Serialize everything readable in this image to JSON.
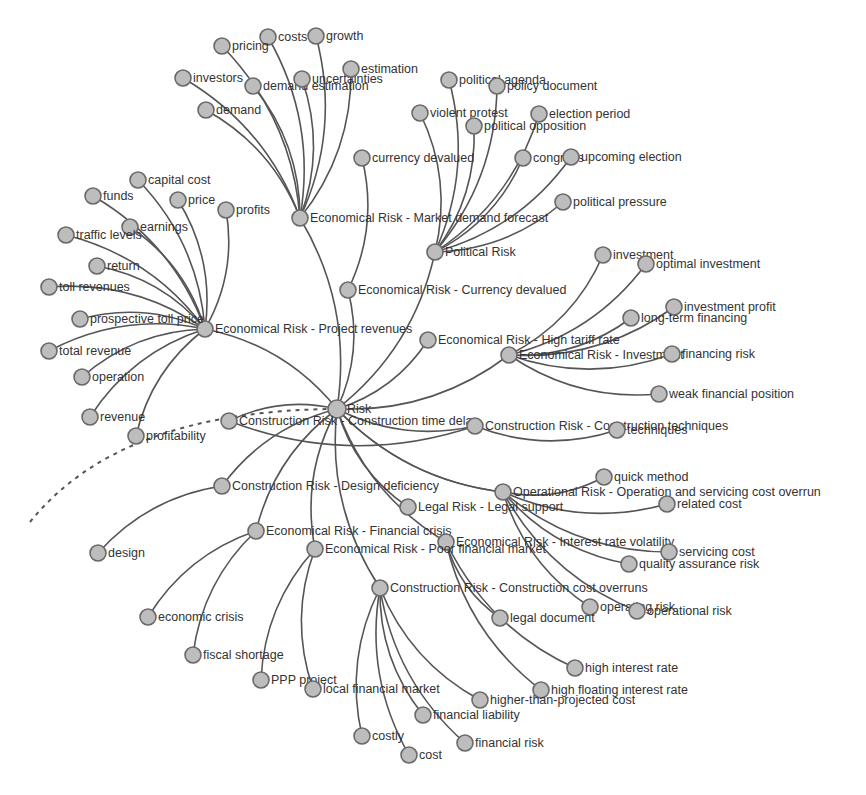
{
  "diagram": {
    "type": "radial-network",
    "root": "Risk",
    "colors": {
      "node_fill": "#bdbdbd",
      "node_stroke": "#6a6a6a",
      "edge": "#555555",
      "label": "#333333"
    },
    "nodes": [
      {
        "id": "risk",
        "label": "Risk",
        "x": 337,
        "y": 409,
        "parent": null
      },
      {
        "id": "mdf",
        "label": "Economical Risk - Market demand forecast",
        "x": 300,
        "y": 218,
        "parent": "risk"
      },
      {
        "id": "pol",
        "label": "Political Risk",
        "x": 435,
        "y": 252,
        "parent": "risk"
      },
      {
        "id": "cur",
        "label": "Economical Risk - Currency devalued",
        "x": 348,
        "y": 290,
        "parent": "risk"
      },
      {
        "id": "rev",
        "label": "Economical Risk - Project revenues",
        "x": 205,
        "y": 329,
        "parent": "risk"
      },
      {
        "id": "htr",
        "label": "Economical Risk - High tariff rate",
        "x": 428,
        "y": 340,
        "parent": "risk"
      },
      {
        "id": "inv",
        "label": "Economical Risk - Investment",
        "x": 509,
        "y": 355,
        "parent": "risk"
      },
      {
        "id": "ctd",
        "label": "Construction Risk - Construction time delay",
        "x": 229,
        "y": 421,
        "parent": "risk"
      },
      {
        "id": "ctech",
        "label": "Construction Risk - Construction techniques",
        "x": 475,
        "y": 426,
        "parent": "risk"
      },
      {
        "id": "dd",
        "label": "Construction Risk - Design deficiency",
        "x": 222,
        "y": 486,
        "parent": "risk"
      },
      {
        "id": "op",
        "label": "Operational Risk - Operation and servicing cost overrun",
        "x": 503,
        "y": 492,
        "parent": "risk"
      },
      {
        "id": "legal",
        "label": "Legal Risk - Legal support",
        "x": 408,
        "y": 507,
        "parent": "risk"
      },
      {
        "id": "fc",
        "label": "Economical Risk - Financial crisis",
        "x": 256,
        "y": 531,
        "parent": "risk"
      },
      {
        "id": "irv",
        "label": "Economical Risk - Interest rate volatility",
        "x": 446,
        "y": 542,
        "parent": "risk"
      },
      {
        "id": "pfm",
        "label": "Economical Risk - Poor financial market",
        "x": 315,
        "y": 549,
        "parent": "risk"
      },
      {
        "id": "cco",
        "label": "Construction Risk - Construction cost overruns",
        "x": 380,
        "y": 588,
        "parent": "risk"
      },
      {
        "id": "costs",
        "label": "costs",
        "x": 268,
        "y": 37,
        "parent": "mdf"
      },
      {
        "id": "growth",
        "label": "growth",
        "x": 316,
        "y": 36,
        "parent": "mdf"
      },
      {
        "id": "pricing",
        "label": "pricing",
        "x": 222,
        "y": 46,
        "parent": "mdf"
      },
      {
        "id": "investors",
        "label": "investors",
        "x": 183,
        "y": 78,
        "parent": "mdf"
      },
      {
        "id": "demest",
        "label": "demand estimation",
        "x": 253,
        "y": 86,
        "parent": "mdf"
      },
      {
        "id": "uncert",
        "label": "uncertainties",
        "x": 302,
        "y": 79,
        "parent": "mdf"
      },
      {
        "id": "estim",
        "label": "estimation",
        "x": 351,
        "y": 69,
        "parent": "mdf"
      },
      {
        "id": "demand",
        "label": "demand",
        "x": 206,
        "y": 110,
        "parent": "mdf"
      },
      {
        "id": "polag",
        "label": "political agenda",
        "x": 449,
        "y": 80,
        "parent": "pol"
      },
      {
        "id": "poldoc",
        "label": "policy document",
        "x": 497,
        "y": 86,
        "parent": "pol"
      },
      {
        "id": "viol",
        "label": "violent protest",
        "x": 420,
        "y": 113,
        "parent": "pol"
      },
      {
        "id": "elper",
        "label": "election period",
        "x": 539,
        "y": 114,
        "parent": "pol"
      },
      {
        "id": "polopp",
        "label": "political opposition",
        "x": 474,
        "y": 126,
        "parent": "pol"
      },
      {
        "id": "congress",
        "label": "congress",
        "x": 523,
        "y": 158,
        "parent": "pol"
      },
      {
        "id": "upel",
        "label": "upcoming election",
        "x": 571,
        "y": 157,
        "parent": "pol"
      },
      {
        "id": "polpres",
        "label": "political pressure",
        "x": 563,
        "y": 202,
        "parent": "pol"
      },
      {
        "id": "curdev",
        "label": "currency devalued",
        "x": 362,
        "y": 158,
        "parent": "cur"
      },
      {
        "id": "capcost",
        "label": "capital cost",
        "x": 138,
        "y": 180,
        "parent": "rev"
      },
      {
        "id": "funds",
        "label": "funds",
        "x": 93,
        "y": 196,
        "parent": "rev"
      },
      {
        "id": "price",
        "label": "price",
        "x": 178,
        "y": 200,
        "parent": "rev"
      },
      {
        "id": "profits",
        "label": "profits",
        "x": 226,
        "y": 210,
        "parent": "rev"
      },
      {
        "id": "earnings",
        "label": "earnings",
        "x": 130,
        "y": 227,
        "parent": "rev"
      },
      {
        "id": "traffic",
        "label": "traffic levels",
        "x": 66,
        "y": 235,
        "parent": "rev"
      },
      {
        "id": "return",
        "label": "return",
        "x": 97,
        "y": 266,
        "parent": "rev"
      },
      {
        "id": "tollrev",
        "label": "toll revenues",
        "x": 49,
        "y": 287,
        "parent": "rev"
      },
      {
        "id": "prosp",
        "label": "prospective toll price",
        "x": 80,
        "y": 319,
        "parent": "rev"
      },
      {
        "id": "totrev",
        "label": "total revenue",
        "x": 49,
        "y": 351,
        "parent": "rev"
      },
      {
        "id": "operation",
        "label": "operation",
        "x": 82,
        "y": 377,
        "parent": "rev"
      },
      {
        "id": "revenue",
        "label": "revenue",
        "x": 90,
        "y": 417,
        "parent": "rev"
      },
      {
        "id": "profit",
        "label": "profitability",
        "x": 136,
        "y": 436,
        "parent": "rev"
      },
      {
        "id": "investment",
        "label": "investment",
        "x": 603,
        "y": 255,
        "parent": "inv"
      },
      {
        "id": "optinv",
        "label": "optimal investment",
        "x": 646,
        "y": 264,
        "parent": "inv"
      },
      {
        "id": "invprof",
        "label": "investment profit",
        "x": 674,
        "y": 307,
        "parent": "inv"
      },
      {
        "id": "ltf",
        "label": "long-term financing",
        "x": 631,
        "y": 318,
        "parent": "inv"
      },
      {
        "id": "finrisk",
        "label": "financing risk",
        "x": 672,
        "y": 354,
        "parent": "inv"
      },
      {
        "id": "weak",
        "label": "weak financial position",
        "x": 659,
        "y": 394,
        "parent": "inv"
      },
      {
        "id": "techniques",
        "label": "techniques",
        "x": 617,
        "y": 430,
        "parent": "ctech"
      },
      {
        "id": "design",
        "label": "design",
        "x": 98,
        "y": 553,
        "parent": "dd"
      },
      {
        "id": "quick",
        "label": "quick method",
        "x": 604,
        "y": 477,
        "parent": "op"
      },
      {
        "id": "related",
        "label": "related cost",
        "x": 667,
        "y": 504,
        "parent": "op"
      },
      {
        "id": "servcost",
        "label": "servicing cost",
        "x": 669,
        "y": 552,
        "parent": "op"
      },
      {
        "id": "qar",
        "label": "quality assurance risk",
        "x": 629,
        "y": 564,
        "parent": "op"
      },
      {
        "id": "oprisk1",
        "label": "operating risk",
        "x": 590,
        "y": 607,
        "parent": "op"
      },
      {
        "id": "oprisk2",
        "label": "operational risk",
        "x": 637,
        "y": 611,
        "parent": "op"
      },
      {
        "id": "legdoc",
        "label": "legal document",
        "x": 500,
        "y": 618,
        "parent": "irv"
      },
      {
        "id": "hir",
        "label": "high interest rate",
        "x": 575,
        "y": 668,
        "parent": "irv"
      },
      {
        "id": "hfir",
        "label": "high floating interest rate",
        "x": 541,
        "y": 690,
        "parent": "irv"
      },
      {
        "id": "econcrisis",
        "label": "economic crisis",
        "x": 148,
        "y": 617,
        "parent": "fc"
      },
      {
        "id": "fiscal",
        "label": "fiscal shortage",
        "x": 193,
        "y": 655,
        "parent": "fc"
      },
      {
        "id": "ppp",
        "label": "PPP project",
        "x": 261,
        "y": 680,
        "parent": "pfm"
      },
      {
        "id": "lfm",
        "label": "local financial market",
        "x": 313,
        "y": 689,
        "parent": "pfm"
      },
      {
        "id": "htpc",
        "label": "higher-than-projected cost",
        "x": 480,
        "y": 700,
        "parent": "cco"
      },
      {
        "id": "finliab",
        "label": "financial liability",
        "x": 423,
        "y": 715,
        "parent": "cco"
      },
      {
        "id": "costly",
        "label": "costly",
        "x": 362,
        "y": 736,
        "parent": "cco"
      },
      {
        "id": "finrisk2",
        "label": "financial risk",
        "x": 465,
        "y": 743,
        "parent": "cco"
      },
      {
        "id": "cost",
        "label": "cost",
        "x": 409,
        "y": 755,
        "parent": "cco"
      }
    ],
    "extra_edges": [
      {
        "from": "ctd",
        "to": "ctech"
      },
      {
        "from": "risk",
        "to": "op"
      }
    ],
    "dashed_path": {
      "from_xy": [
        30,
        522
      ],
      "to": "risk"
    }
  }
}
